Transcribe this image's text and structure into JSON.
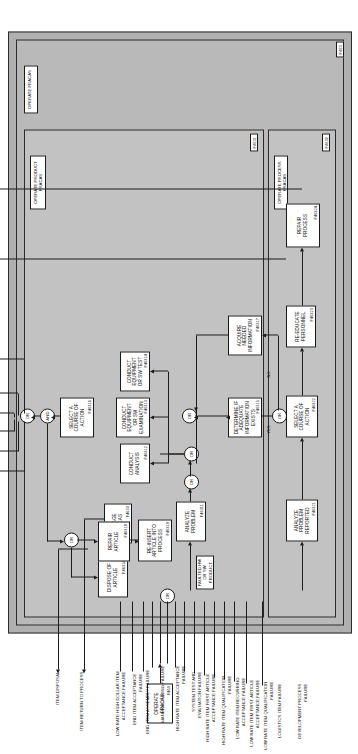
{
  "figure": {
    "title": "OPERATE FRACAS",
    "top_node_id": "F460",
    "diagram_type": "IDEF0 process flow"
  },
  "bands": [
    {
      "label": "OPERATE FRACAS",
      "id": "",
      "name": "band-operate-fracas"
    },
    {
      "label": "OPERATE PRODUCT FRACAS",
      "id": "F4631",
      "name": "band-operate-product-fracas"
    },
    {
      "label": "OPERATE PROCESS FRACAS",
      "id": "F4632",
      "name": "band-operate-process-fracas"
    },
    {
      "label": "",
      "id": "F463",
      "name": "band-outer-id"
    }
  ],
  "boxes": [
    {
      "label": "MANAGE FRACAS",
      "id": "F4633",
      "name": "box-manage-fracas"
    },
    {
      "label": "ANALYZE PROBLEM",
      "id": "F46311",
      "name": "box-analyze-problem"
    },
    {
      "label": "CONDUCT ANALYSIS",
      "id": "F46312",
      "name": "box-conduct-analysis"
    },
    {
      "label": "CONDUCT EQUIPMENT OR SW EXAMINATION",
      "id": "F46313",
      "name": "box-conduct-equipment-examination"
    },
    {
      "label": "CONDUCT EQUIPMENT OR SW TEST",
      "id": "F46314",
      "name": "box-conduct-equipment-test"
    },
    {
      "label": "DETERMINE IF ADEQUATE INFORMATION EXISTS",
      "id": "F46315",
      "name": "box-determine-adequate-information"
    },
    {
      "label": "SELECT A COURSE OF ACTION",
      "id": "F46316",
      "name": "box-select-course-of-action-product"
    },
    {
      "label": "ACQUIRE NEEDED INFORMATION",
      "id": "F46317",
      "name": "box-acquire-needed-information"
    },
    {
      "label": "REPAIR ARTICLE",
      "id": "F46318",
      "name": "box-repair-article"
    },
    {
      "label": "RE-INSERT ARTICLE INTO PROCESS",
      "id": "F46319",
      "name": "box-reinsert-article"
    },
    {
      "label": "DISPOSE OF ARTICLE",
      "id": "F4631A",
      "name": "box-dispose-of-article"
    },
    {
      "label": "ANALYZE PROBLEM REPORTED",
      "id": "F46321",
      "name": "box-analyze-problem-reported"
    },
    {
      "label": "SELECT A COURSE OF ACTION",
      "id": "F46322",
      "name": "box-select-course-of-action-process"
    },
    {
      "label": "RE-EDUCATE PERSONNEL",
      "id": "F46323",
      "name": "box-re-educate-personnel"
    },
    {
      "label": "REPAIR PROCESS",
      "id": "F46324",
      "name": "box-repair-process"
    }
  ],
  "gates": [
    {
      "label": "OR",
      "name": "gate-inputs-or"
    },
    {
      "label": "OR",
      "name": "gate-analysis-branch-or"
    },
    {
      "label": "OR",
      "name": "gate-analysis-merge-or"
    },
    {
      "label": "OR",
      "name": "gate-information-or"
    },
    {
      "label": "OR",
      "name": "gate-adequate-info-or"
    },
    {
      "label": "OR",
      "name": "gate-article-action-or"
    },
    {
      "label": "AND",
      "name": "gate-and-product"
    },
    {
      "label": "OR",
      "name": "gate-outputs-or"
    }
  ],
  "flow_tags": [
    {
      "label": "YES",
      "name": "flow-tag-yes"
    },
    {
      "label": "NO",
      "name": "flow-tag-no"
    }
  ],
  "inputs": [
    "ITEM DISPOSAL",
    "ITEM RETURN TO PROCESS",
    "LOW RATE HIGH DOLLAR ITEM ACCEPTANCE FAILURE",
    "END ITEM ACCEPTANCE FAILURE",
    "END ITEM ASSEMBLY FAILURE",
    "MANUFACTURING FAILURE",
    "HIGH RATE ITEM ACCEPTANCE FAILURE",
    "SYSTEM TEST AND EVALUATION FAILURE",
    "HIGH RATE ITEM FIRST ARTICLE ACCEPTANCE FAILURE",
    "HIGH RATE ITEM QUALIFICATION FAILURE",
    "LOW RATE ITEM RECURRING ACCEPTANCE FAILURE",
    "LOW RATE ITEM FIRST ARTICLE ACCEPTANCE FAILURE",
    "LOW RATE ITEM QUALIFICATION FAILURE",
    "LOGISTICS ITEM FAILURE",
    "DEVELOPMENT PROCESS FAILURE"
  ],
  "outputs": [
    "NO ACTION REQUIRED",
    "FRACAS DIRECTED DESIGN CHANGE",
    "FRACAS DIRECTED REQUIREMENT'S CHANGE",
    "FRACAS DIRECTED MATERIAL AND PROCUREMENT CHANGE",
    "FRACAS DIRECTED VERIFICATION STATUS & PLANS CHANGE",
    "FRACAS DIRECTED MANUFACTURING CHANGE",
    "REPAIRED PROCESS",
    "REPAIRED MISUNDERSTANDING"
  ],
  "internal_labels": [
    "FAULTED HW OR SW PRODUCT"
  ],
  "colors": {
    "band_fill": "#b9b9b9",
    "band_inner_fill": "#c2c2c2",
    "box_fill": "#ffffff",
    "line": "#1c1c1c"
  }
}
